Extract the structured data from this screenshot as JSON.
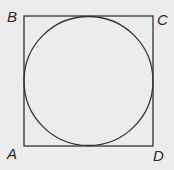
{
  "diagram": {
    "type": "geometry",
    "colors": {
      "background": "#ececec",
      "stroke": "#333333",
      "label": "#2a2a2a"
    },
    "square": {
      "x": 24,
      "y": 16,
      "width": 129,
      "height": 130,
      "vertices": [
        "A",
        "B",
        "C",
        "D"
      ]
    },
    "circle": {
      "cx": 88.5,
      "cy": 81,
      "r": 64.5
    },
    "labels": {
      "A": "A",
      "B": "B",
      "C": "C",
      "D": "D"
    }
  }
}
